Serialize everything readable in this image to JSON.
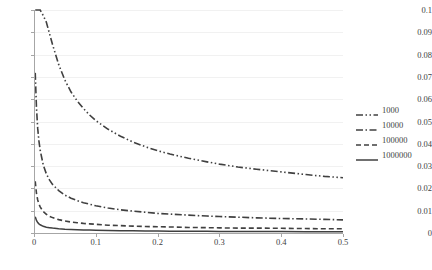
{
  "chart_data": {
    "type": "line",
    "title": "",
    "xlabel": "",
    "ylabel": "",
    "xlim": [
      0,
      0.5
    ],
    "ylim": [
      0,
      0.1
    ],
    "grid": true,
    "legend_position": "right",
    "x_ticks": [
      "0",
      "0.1",
      "0.2",
      "0.3",
      "0.4",
      "0.5"
    ],
    "x_tick_values": [
      0,
      0.1,
      0.2,
      0.3,
      0.4,
      0.5
    ],
    "y_ticks": [
      "0",
      "0.01",
      "0.02",
      "0.03",
      "0.04",
      "0.05",
      "0.06",
      "0.07",
      "0.08",
      "0.09",
      "0.1"
    ],
    "y_tick_values": [
      0,
      0.01,
      0.02,
      0.03,
      0.04,
      0.05,
      0.06,
      0.07,
      0.08,
      0.09,
      0.1
    ],
    "x": [
      0.002,
      0.004,
      0.006,
      0.008,
      0.01,
      0.015,
      0.02,
      0.025,
      0.03,
      0.04,
      0.05,
      0.06,
      0.07,
      0.08,
      0.09,
      0.1,
      0.12,
      0.14,
      0.16,
      0.18,
      0.2,
      0.22,
      0.25,
      0.28,
      0.3,
      0.33,
      0.36,
      0.4,
      0.44,
      0.47,
      0.5
    ],
    "series": [
      {
        "name": "1000",
        "dash": "dash-dot-dot",
        "color": "#404040",
        "values": [
          0.1,
          0.1,
          0.1,
          0.1,
          0.1,
          0.0975,
          0.0945,
          0.0895,
          0.0845,
          0.0755,
          0.0685,
          0.0632,
          0.0592,
          0.0558,
          0.0529,
          0.0504,
          0.0465,
          0.0434,
          0.0408,
          0.0387,
          0.0369,
          0.0354,
          0.0335,
          0.0319,
          0.0309,
          0.0296,
          0.0286,
          0.0274,
          0.0262,
          0.0254,
          0.0248
        ]
      },
      {
        "name": "10000",
        "dash": "dash-dot",
        "color": "#404040",
        "values": [
          0.0718,
          0.0562,
          0.0469,
          0.0412,
          0.0371,
          0.0305,
          0.0265,
          0.0238,
          0.0218,
          0.019,
          0.017,
          0.0156,
          0.0145,
          0.0136,
          0.0129,
          0.0122,
          0.0112,
          0.0104,
          0.0098,
          0.0093,
          0.0088,
          0.0085,
          0.008,
          0.0076,
          0.0074,
          0.0071,
          0.0068,
          0.0065,
          0.0063,
          0.0061,
          0.0059
        ]
      },
      {
        "name": "100000",
        "dash": "dashed",
        "color": "#404040",
        "values": [
          0.0232,
          0.0178,
          0.0148,
          0.013,
          0.0117,
          0.0096,
          0.0084,
          0.0075,
          0.0069,
          0.006,
          0.0054,
          0.0049,
          0.0046,
          0.0043,
          0.0041,
          0.0039,
          0.0035,
          0.0033,
          0.0031,
          0.0029,
          0.0028,
          0.0027,
          0.0025,
          0.0024,
          0.0023,
          0.0022,
          0.0022,
          0.0021,
          0.002,
          0.0019,
          0.0019
        ]
      },
      {
        "name": "1000000",
        "dash": "solid",
        "color": "#404040",
        "values": [
          0.0073,
          0.0056,
          0.0047,
          0.0041,
          0.0037,
          0.003,
          0.0026,
          0.0024,
          0.0022,
          0.0019,
          0.0017,
          0.0016,
          0.0015,
          0.0014,
          0.0013,
          0.0012,
          0.0011,
          0.001,
          0.001,
          0.0009,
          0.0009,
          0.0008,
          0.0008,
          0.0008,
          0.0007,
          0.0007,
          0.0007,
          0.0007,
          0.0006,
          0.0006,
          0.0006
        ]
      }
    ]
  }
}
